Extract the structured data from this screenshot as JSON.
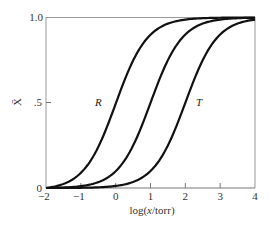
{
  "chart_data": {
    "type": "line",
    "title": "",
    "xlabel_prefix": "log(",
    "xlabel_italic": "x",
    "xlabel_suffix": "/torr)",
    "xlabel": "log(x/torr)",
    "ylabel": "X̄",
    "xlim": [
      -2,
      4
    ],
    "ylim": [
      0,
      1.0
    ],
    "x_ticks": [
      -2,
      -1,
      0,
      1,
      2,
      3,
      4
    ],
    "x_tick_labels": [
      "−2",
      "−1",
      "0",
      "1",
      "2",
      "3",
      "4"
    ],
    "y_ticks": [
      0,
      0.5,
      1.0
    ],
    "y_tick_labels": [
      "0",
      ".5",
      "1.0"
    ],
    "grid": false,
    "legend": "none",
    "annotations": [
      {
        "text": "R",
        "x": -0.5,
        "y": 0.5
      },
      {
        "text": "T",
        "x": 2.45,
        "y": 0.5
      }
    ],
    "series": [
      {
        "name": "R",
        "midpoint": 0.0,
        "x": [
          -2,
          -1.5,
          -1,
          -0.5,
          0,
          0.5,
          1,
          1.5,
          2,
          3,
          4
        ],
        "values": [
          0.0,
          0.03,
          0.1,
          0.25,
          0.5,
          0.75,
          0.9,
          0.97,
          0.99,
          1.0,
          1.0
        ]
      },
      {
        "name": "middle",
        "midpoint": 1.0,
        "x": [
          -2,
          -1,
          -0.5,
          0,
          0.5,
          1,
          1.5,
          2,
          2.5,
          3,
          4
        ],
        "values": [
          0.0,
          0.0,
          0.03,
          0.1,
          0.25,
          0.5,
          0.75,
          0.9,
          0.97,
          0.99,
          1.0
        ]
      },
      {
        "name": "T",
        "midpoint": 2.0,
        "x": [
          -2,
          -1,
          0,
          0.5,
          1,
          1.5,
          2,
          2.5,
          3,
          3.5,
          4
        ],
        "values": [
          0.0,
          0.0,
          0.0,
          0.03,
          0.1,
          0.25,
          0.5,
          0.75,
          0.9,
          0.97,
          1.0
        ]
      }
    ]
  }
}
